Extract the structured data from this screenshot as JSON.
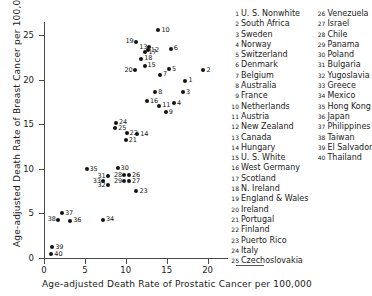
{
  "chart_data": {
    "type": "scatter",
    "title": "",
    "xlabel": "Age-adjusted Death Rate of Prostatic Cancer per 100,000",
    "ylabel": "Age-adjusted Death Rate of Breast Cancer per 100,000",
    "xlim": [
      0,
      22.5
    ],
    "ylim": [
      0,
      26.5
    ],
    "xticks": [
      0,
      5,
      10,
      15,
      20
    ],
    "yticks": [
      0,
      5,
      10,
      15,
      20,
      25
    ],
    "xtick_labels": [
      "0",
      "5",
      "10",
      "15",
      "20"
    ],
    "ytick_labels": [
      "0",
      "5",
      "10",
      "15",
      "20",
      "25"
    ],
    "grid": false,
    "legend_position": "right",
    "marker": "filled-circle",
    "point_labels": "numeric-index",
    "points": [
      {
        "id": 1,
        "label": "1",
        "name": "U. S., Nonwhite",
        "x": 17.3,
        "y": 19.9
      },
      {
        "id": 2,
        "label": "2",
        "name": "South Africa",
        "x": 19.5,
        "y": 21.1
      },
      {
        "id": 3,
        "label": "3",
        "name": "Sweden",
        "x": 17.0,
        "y": 18.6
      },
      {
        "id": 4,
        "label": "4",
        "name": "Norway",
        "x": 15.9,
        "y": 17.4
      },
      {
        "id": 5,
        "label": "5",
        "name": "Switzerland",
        "x": 15.3,
        "y": 21.2
      },
      {
        "id": 6,
        "label": "6",
        "name": "Denmark",
        "x": 15.5,
        "y": 23.5
      },
      {
        "id": 7,
        "label": "7",
        "name": "Belgium",
        "x": 14.2,
        "y": 20.6
      },
      {
        "id": 8,
        "label": "8",
        "name": "Australia",
        "x": 13.6,
        "y": 18.6
      },
      {
        "id": 9,
        "label": "9",
        "name": "France",
        "x": 14.9,
        "y": 16.4
      },
      {
        "id": 10,
        "label": "10",
        "name": "Netherlands",
        "x": 14.0,
        "y": 25.6
      },
      {
        "id": 11,
        "label": "11",
        "name": "Austria",
        "x": 14.1,
        "y": 17.1
      },
      {
        "id": 12,
        "label": "12",
        "name": "New Zealand",
        "x": 12.7,
        "y": 23.3
      },
      {
        "id": 13,
        "label": "13",
        "name": "Canada",
        "x": 12.9,
        "y": 23.7
      },
      {
        "id": 14,
        "label": "14",
        "name": "Hungary",
        "x": 11.4,
        "y": 13.9
      },
      {
        "id": 15,
        "label": "15",
        "name": "U. S., White",
        "x": 12.3,
        "y": 21.6
      },
      {
        "id": 16,
        "label": "16",
        "name": "West Germany",
        "x": 12.6,
        "y": 17.6
      },
      {
        "id": 17,
        "label": "17",
        "name": "Scotland",
        "x": 12.4,
        "y": 23.1
      },
      {
        "id": 18,
        "label": "18",
        "name": "N. Ireland",
        "x": 11.9,
        "y": 22.4
      },
      {
        "id": 19,
        "label": "19",
        "name": "England & Wales",
        "x": 11.2,
        "y": 24.3
      },
      {
        "id": 20,
        "label": "20",
        "name": "Ireland",
        "x": 11.1,
        "y": 21.1
      },
      {
        "id": 21,
        "label": "21",
        "name": "Portugal",
        "x": 10.0,
        "y": 13.2
      },
      {
        "id": 22,
        "label": "22",
        "name": "Finland",
        "x": 10.1,
        "y": 14.0
      },
      {
        "id": 23,
        "label": "23",
        "name": "Puerto Rico",
        "x": 11.3,
        "y": 7.5
      },
      {
        "id": 24,
        "label": "24",
        "name": "Italy",
        "x": 8.8,
        "y": 15.2
      },
      {
        "id": 25,
        "label": "25",
        "name": "Czechoslovakia",
        "x": 8.7,
        "y": 14.6
      },
      {
        "id": 26,
        "label": "26",
        "name": "Venezuela",
        "x": 10.4,
        "y": 9.3
      },
      {
        "id": 27,
        "label": "27",
        "name": "Israel",
        "x": 10.4,
        "y": 8.6
      },
      {
        "id": 28,
        "label": "28",
        "name": "Chile",
        "x": 9.8,
        "y": 9.3
      },
      {
        "id": 29,
        "label": "29",
        "name": "Panama",
        "x": 9.8,
        "y": 8.6
      },
      {
        "id": 30,
        "label": "30",
        "name": "Poland",
        "x": 9.0,
        "y": 10.1
      },
      {
        "id": 31,
        "label": "31",
        "name": "Bulgaria",
        "x": 7.8,
        "y": 9.2
      },
      {
        "id": 32,
        "label": "32",
        "name": "Yugoslavia",
        "x": 7.8,
        "y": 8.2
      },
      {
        "id": 33,
        "label": "33",
        "name": "Greece",
        "x": 7.2,
        "y": 8.6
      },
      {
        "id": 34,
        "label": "34",
        "name": "Mexico",
        "x": 7.2,
        "y": 4.3
      },
      {
        "id": 35,
        "label": "35",
        "name": "Hong Kong",
        "x": 5.2,
        "y": 10.0
      },
      {
        "id": 36,
        "label": "36",
        "name": "Japan",
        "x": 3.2,
        "y": 4.2
      },
      {
        "id": 37,
        "label": "37",
        "name": "Philippines",
        "x": 2.2,
        "y": 5.0
      },
      {
        "id": 38,
        "label": "38",
        "name": "Taiwan",
        "x": 1.7,
        "y": 4.3
      },
      {
        "id": 39,
        "label": "39",
        "name": "El Salvador",
        "x": 1.0,
        "y": 1.2
      },
      {
        "id": 40,
        "label": "40",
        "name": "Thailand",
        "x": 0.9,
        "y": 0.4
      }
    ]
  },
  "legend": {
    "column1": [
      {
        "num": "1",
        "name": "U. S.  Nonwhite"
      },
      {
        "num": "2",
        "name": "South Africa"
      },
      {
        "num": "3",
        "name": "Sweden"
      },
      {
        "num": "4",
        "name": "Norway"
      },
      {
        "num": "5",
        "name": "Switzerland"
      },
      {
        "num": "6",
        "name": "Denmark"
      },
      {
        "num": "7",
        "name": "Belgium"
      },
      {
        "num": "8",
        "name": "Australia"
      },
      {
        "num": "9",
        "name": "France"
      },
      {
        "num": "10",
        "name": "Netherlands"
      },
      {
        "num": "11",
        "name": "Austria"
      },
      {
        "num": "12",
        "name": "New  Zealand"
      },
      {
        "num": "13",
        "name": "Canada"
      },
      {
        "num": "14",
        "name": "Hungary"
      },
      {
        "num": "15",
        "name": "U. S.  White"
      },
      {
        "num": "16",
        "name": "West Germany"
      },
      {
        "num": "17",
        "name": "Scotland"
      },
      {
        "num": "18",
        "name": "N.  Ireland"
      },
      {
        "num": "19",
        "name": "England &  Wales"
      },
      {
        "num": "20",
        "name": "Ireland"
      },
      {
        "num": "21",
        "name": "Portugal"
      },
      {
        "num": "22",
        "name": "Finland"
      },
      {
        "num": "23",
        "name": "Puerto Rico"
      },
      {
        "num": "24",
        "name": "Italy"
      },
      {
        "num": "25",
        "name": "Czechoslovakia"
      }
    ],
    "column2": [
      {
        "num": "26",
        "name": "Venezuela"
      },
      {
        "num": "27",
        "name": "Israel"
      },
      {
        "num": "28",
        "name": "Chile"
      },
      {
        "num": "29",
        "name": "Panama"
      },
      {
        "num": "30",
        "name": "Poland"
      },
      {
        "num": "31",
        "name": "Bulgaria"
      },
      {
        "num": "32",
        "name": "Yugoslavia"
      },
      {
        "num": "33",
        "name": "Greece"
      },
      {
        "num": "34",
        "name": "Mexico"
      },
      {
        "num": "35",
        "name": "Hong Kong"
      },
      {
        "num": "36",
        "name": "Japan"
      },
      {
        "num": "37",
        "name": "Philippines"
      },
      {
        "num": "38",
        "name": "Taiwan"
      },
      {
        "num": "39",
        "name": "El  Salvador"
      },
      {
        "num": "40",
        "name": "Thailand"
      }
    ]
  }
}
